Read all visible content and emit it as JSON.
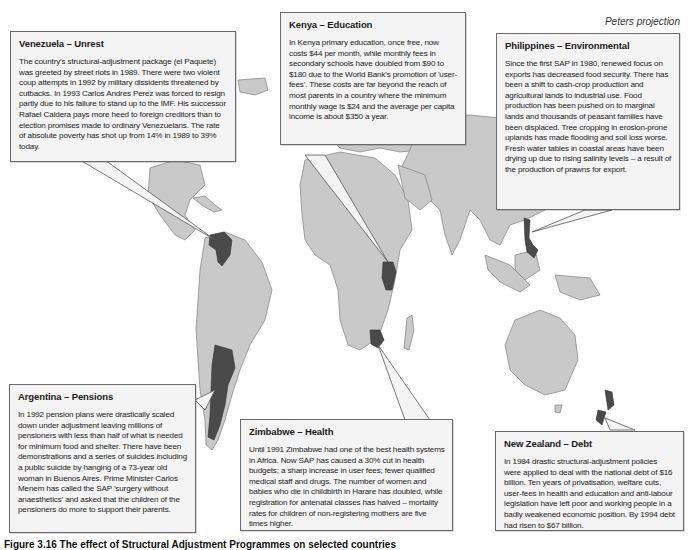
{
  "map": {
    "projection_label": "Peters projection",
    "colors": {
      "land": "#c9c9c9",
      "highlighted_country": "#4a4a4a",
      "callout_background": "#f4f4f4",
      "border": "#6a6a6a"
    },
    "highlighted_countries": [
      "Venezuela",
      "Kenya",
      "Philippines",
      "Argentina",
      "Zimbabwe",
      "New Zealand"
    ]
  },
  "callouts": {
    "venezuela": {
      "title": "Venezuela – Unrest",
      "body": "The country's structural-adjustment package (el Paquete) was greeted by street riots in 1989. There were two violent coup attempts in 1992 by military dissidents threatened by cutbacks. In 1993 Carlos Andres Perez was forced to resign partly due to his failure to stand up to the IMF. His successor Rafael Caldera pays more heed to foreign creditors than to election promises made to ordinary Venezuelans. The rate of absolute poverty has shot up from 14% in 1989 to 39% today."
    },
    "kenya": {
      "title": "Kenya – Education",
      "body": "In Kenya primary education, once free, now costs $44 per month, while monthly fees in secondary schools have doubled from $90 to $180 due to the World Bank's promotion of 'user-fees'. These costs are far beyond the reach of most parents in a country where the minimum monthly wage is $24 and the average per capita income is about $350 a year."
    },
    "philippines": {
      "title": "Philippines – Environmental",
      "body": "Since the first SAP in 1980, renewed focus on exports has decreased food security. There has been a shift to cash-crop production and agricultural lands to industrial use. Food production has been pushed on to marginal lands and thousands of peasant families have been displaced. Tree cropping in erosion-prone uplands has made flooding and soil loss worse. Fresh water tables in coastal areas have been drying up due to rising salinity levels – a result of the production of prawns for export."
    },
    "argentina": {
      "title": "Argentina – Pensions",
      "body": "In 1992 pension plans were drastically scaled down under adjustment leaving millions of pensioners with less than half of what is needed for minimum food and shelter. There have been demonstrations and a series of suicides including a public suicide by hanging of a 73-year old woman in Buenos Aires. Prime Minister Carlos Menem has called the SAP 'surgery without anaesthetics' and asked that the children of the pensioners do more to support their parents."
    },
    "zimbabwe": {
      "title": "Zimbabwe – Health",
      "body": "Until 1991 Zimbabwe had one of the best health systems in Africa. Now SAP has caused a 30% cut in health budgets; a sharp increase in user fees; fewer qualified medical staff and drugs. The number of women and babies who die in childbirth in Harare has doubled, while registration for antenatal classes has halved – mortality rates for children of non-registering mothers are five times higher."
    },
    "new_zealand": {
      "title": "New Zealand – Debt",
      "body": "In 1984 drastic structural-adjustment policies were applied to deal with the national debt of $16 billion. Ten years of privatisation, welfare cuts, user-fees in health and education and anti-labour legislation have left poor and working people in a badly weakened economic position. By 1994 debt had risen to $67 billion."
    }
  },
  "caption": "Figure 3.16 The effect of Structural Adjustment Programmes on selected countries"
}
